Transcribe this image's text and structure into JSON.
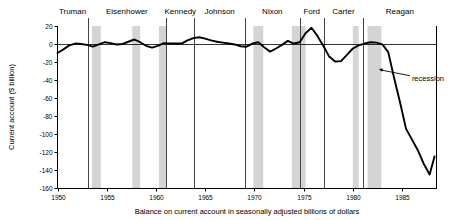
{
  "chart_data": {
    "type": "line",
    "title": "",
    "caption": "Balance on current account in seasonally adjusted billions of dollars",
    "ylabel": "Current account ($ billion)",
    "xlabel": "",
    "ylim": [
      -160,
      20
    ],
    "xlim": [
      1950,
      1988.5
    ],
    "yticks": [
      20,
      0,
      -20,
      -40,
      -60,
      -80,
      -100,
      -120,
      -140,
      -160
    ],
    "ytick_labels": [
      "20",
      "0",
      "-20",
      "-40",
      "-60",
      "-80",
      "-100",
      "-120",
      "-140",
      "-160"
    ],
    "xticks": [
      1950,
      1955,
      1960,
      1965,
      1970,
      1975,
      1980,
      1985
    ],
    "xtick_labels": [
      "1950",
      "1955",
      "1960",
      "1965",
      "1970",
      "1975",
      "1980",
      "1985"
    ],
    "grid": false,
    "zero_line": true,
    "line_color": "#000000",
    "recession_color": "#cccccc",
    "divider_color": "#444444",
    "series": [
      {
        "name": "Current account balance",
        "x": [
          1950.0,
          1950.6,
          1951.2,
          1951.8,
          1952.4,
          1953.0,
          1953.6,
          1954.2,
          1954.8,
          1955.4,
          1956.0,
          1956.6,
          1957.2,
          1957.8,
          1958.4,
          1959.0,
          1959.6,
          1960.2,
          1960.8,
          1961.4,
          1962.0,
          1962.6,
          1963.2,
          1963.8,
          1964.4,
          1965.0,
          1965.6,
          1966.2,
          1966.8,
          1967.4,
          1968.0,
          1968.6,
          1969.2,
          1969.8,
          1970.4,
          1971.0,
          1971.6,
          1972.2,
          1972.8,
          1973.4,
          1974.0,
          1974.6,
          1975.2,
          1975.8,
          1976.4,
          1977.0,
          1977.6,
          1978.2,
          1978.8,
          1979.4,
          1980.0,
          1980.6,
          1981.2,
          1981.8,
          1982.4,
          1983.0,
          1983.6,
          1984.2,
          1984.8,
          1985.4,
          1986.0,
          1986.6,
          1987.2,
          1987.8,
          1988.3
        ],
        "y": [
          -10.0,
          -6.0,
          -1.5,
          0.5,
          0.0,
          -1.0,
          -3.0,
          -0.5,
          2.0,
          1.0,
          -0.5,
          0.0,
          2.5,
          5.0,
          2.0,
          -2.0,
          -4.0,
          -2.0,
          1.0,
          0.5,
          0.5,
          0.5,
          4.0,
          6.5,
          7.5,
          6.0,
          4.0,
          2.5,
          1.5,
          0.5,
          -0.5,
          -2.5,
          -3.0,
          0.5,
          2.0,
          -3.5,
          -8.5,
          -5.0,
          -1.0,
          3.5,
          0.5,
          2.0,
          12.0,
          18.0,
          9.0,
          -2.0,
          -14.0,
          -19.5,
          -19.0,
          -12.0,
          -5.0,
          -1.5,
          0.5,
          2.0,
          1.5,
          -0.5,
          -9.0,
          -38.0,
          -65.0,
          -94.0,
          -106.0,
          -118.0,
          -133.0,
          -145.0,
          -125.0
        ]
      }
    ],
    "presidents": [
      {
        "name": "Truman",
        "start": 1950.0,
        "end": 1953.05
      },
      {
        "name": "Eisenhower",
        "start": 1953.05,
        "end": 1961.05
      },
      {
        "name": "Kennedy",
        "start": 1961.05,
        "end": 1963.9
      },
      {
        "name": "Johnson",
        "start": 1963.9,
        "end": 1969.05
      },
      {
        "name": "Nixon",
        "start": 1969.05,
        "end": 1974.6
      },
      {
        "name": "Ford",
        "start": 1974.6,
        "end": 1977.05
      },
      {
        "name": "Carter",
        "start": 1977.05,
        "end": 1981.05
      },
      {
        "name": "Reagan",
        "start": 1981.05,
        "end": 1988.5
      }
    ],
    "president_dividers": [
      1953.05,
      1961.05,
      1963.9,
      1969.05,
      1974.6,
      1977.05,
      1981.05
    ],
    "recessions": [
      {
        "start": 1953.5,
        "end": 1954.4
      },
      {
        "start": 1957.6,
        "end": 1958.4
      },
      {
        "start": 1960.3,
        "end": 1961.1
      },
      {
        "start": 1969.9,
        "end": 1970.9
      },
      {
        "start": 1973.8,
        "end": 1975.2
      },
      {
        "start": 1980.0,
        "end": 1980.6
      },
      {
        "start": 1981.5,
        "end": 1982.9
      }
    ],
    "annotations": [
      {
        "label": "recession",
        "text_x": 1986.0,
        "text_y": -38.0,
        "point_x": 1982.5,
        "point_y": -27.0
      }
    ]
  }
}
